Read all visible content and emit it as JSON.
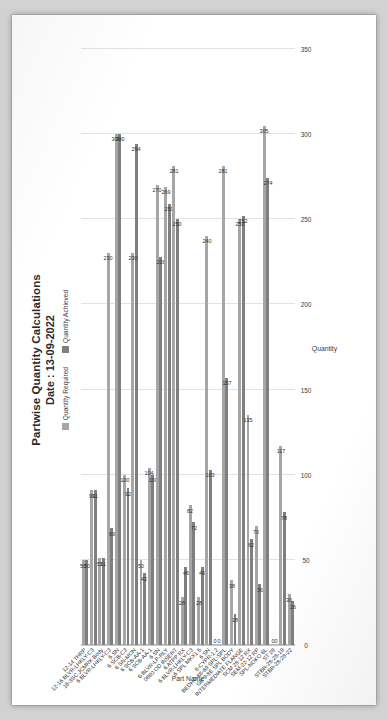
{
  "page": {
    "background": "#d2d2d2",
    "paper": "#ffffff"
  },
  "chart_header": {
    "title": "Partwise Quantity Calculations",
    "subtitle": "Date : 13-09-2022"
  },
  "legend": {
    "position": "top-center",
    "items": [
      {
        "label": "Quantity Required",
        "color": "#a6a6a6"
      },
      {
        "label": "Quantity Achieved",
        "color": "#7f7f7f"
      }
    ]
  },
  "chart_data": {
    "type": "bar",
    "orientation": "horizontal",
    "title": "Partwise Quantity Calculations",
    "subtitle": "Date : 13-09-2022",
    "xlabel": "Part Name",
    "ylabel": "Quantity",
    "ylim": [
      0,
      350
    ],
    "yticks": [
      0,
      50,
      100,
      150,
      200,
      250,
      300,
      350
    ],
    "grid": true,
    "legend_position": "top-center",
    "categories": [
      "12-14 THRP",
      "12-16 BLVR-LHKLY-C3",
      "16-3SC JCMRK Body",
      "6 BLVR-LHKLY-C3",
      "6 SN",
      "6 SCB-C3",
      "6 SN-MON",
      "6 SCB-AA-1",
      "6 SCB-AA-1",
      "6 SN",
      "6-BLVR-LP-RLY",
      "0880 OD INSERT",
      "6 ATPP RX",
      "6 BLVR-LHKLY-C3",
      "6 SPL MKX1.5",
      "6 SN",
      "8-CYPR-1.2",
      "BEDHO 68-69 SPL-SPL",
      "GB 9-8E SPL BODY",
      "INTERMEDIATE FLANGE",
      "SCM 28-12 RX",
      "SEM-22-12 RP",
      "SPL-NOKO 6L",
      "ST 28",
      "STBR-28-28-19",
      "STBR-28-28-22"
    ],
    "series": [
      {
        "name": "Quantity Required",
        "color": "#a6a6a6",
        "values": [
          50,
          91,
          51,
          230,
          300,
          100,
          230,
          50,
          104,
          270,
          269,
          281,
          28,
          82,
          28,
          240,
          0,
          281,
          38,
          250,
          135,
          70,
          305,
          0,
          117,
          30
        ]
      },
      {
        "name": "Quantity Achieved",
        "color": "#7f7f7f",
        "values": [
          50,
          91,
          51,
          69,
          300,
          92,
          294,
          42,
          100,
          228,
          259,
          250,
          46,
          72,
          46,
          103,
          0,
          157,
          18,
          252,
          62,
          36,
          274,
          0,
          78,
          26
        ]
      }
    ],
    "data_labels": [
      {
        "category": "12-14 THRP",
        "required": "50",
        "achieved": "50"
      },
      {
        "category": "12-16 BLVR-LHKLY-C3",
        "required": "91",
        "achieved": "91"
      },
      {
        "category": "16-3SC JCMRK Body",
        "required": "51",
        "achieved": "51"
      },
      {
        "category": "6 BLVR-LHKLY-C3",
        "required": "230",
        "achieved": "69"
      },
      {
        "category": "6 SN",
        "required": "300",
        "achieved": "300"
      },
      {
        "category": "6 SCB-C3",
        "required": "100",
        "achieved": "92"
      },
      {
        "category": "6 SN-MON",
        "required": "230",
        "achieved": "294"
      },
      {
        "category": "6 SCB-AA-1",
        "required": "50",
        "achieved": "42"
      },
      {
        "category": "6 SCB-AA-1",
        "required": "104",
        "achieved": "100"
      },
      {
        "category": "6 SN",
        "required": "270",
        "achieved": "228"
      },
      {
        "category": "6-BLVR-LP-RLY",
        "required": "269",
        "achieved": "259"
      },
      {
        "category": "0880 OD INSERT",
        "required": "281",
        "achieved": "250"
      },
      {
        "category": "6 ATPP RX",
        "required": "28",
        "achieved": "46"
      },
      {
        "category": "6 BLVR-LHKLY-C3",
        "required": "82",
        "achieved": "72"
      },
      {
        "category": "6 SPL MKX1.5",
        "required": "28",
        "achieved": "46"
      },
      {
        "category": "6 SN",
        "required": "240",
        "achieved": "103"
      },
      {
        "category": "8-CYPR-1.2",
        "required": "0",
        "achieved": "0"
      },
      {
        "category": "BEDHO 68-69 SPL-SPL",
        "required": "281",
        "achieved": "157"
      },
      {
        "category": "GB 9-8E SPL BODY",
        "required": "38",
        "achieved": "18"
      },
      {
        "category": "INTERMEDIATE FLANGE",
        "required": "250",
        "achieved": "252"
      },
      {
        "category": "SCM 28-12 RX",
        "required": "135",
        "achieved": "62"
      },
      {
        "category": "SEM-22-12 RP",
        "required": "70",
        "achieved": "36"
      },
      {
        "category": "SPL-NOKO 6L",
        "required": "305",
        "achieved": "274"
      },
      {
        "category": "ST 28",
        "required": "0",
        "achieved": "0"
      },
      {
        "category": "STBR-28-28-19",
        "required": "117",
        "achieved": "78"
      },
      {
        "category": "STBR-28-28-22",
        "required": "30",
        "achieved": "26"
      }
    ]
  }
}
